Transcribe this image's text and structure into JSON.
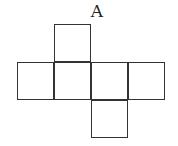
{
  "diagram": {
    "type": "cube-net",
    "label": "A",
    "line_color": "#333333",
    "cells": [
      {
        "name": "top-face",
        "row": 0,
        "col": 1
      },
      {
        "name": "left-face",
        "row": 1,
        "col": 0
      },
      {
        "name": "center-left-face",
        "row": 1,
        "col": 1
      },
      {
        "name": "center-right-face",
        "row": 1,
        "col": 2
      },
      {
        "name": "right-face",
        "row": 1,
        "col": 3
      },
      {
        "name": "bottom-face",
        "row": 2,
        "col": 2
      }
    ]
  }
}
